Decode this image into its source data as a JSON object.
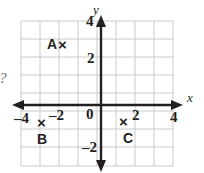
{
  "figure": {
    "stray_mark": "?",
    "axes": {
      "x_label": "x",
      "y_label": "y",
      "origin_label": "0",
      "x_ticks": [
        {
          "value": -4,
          "text": "–4"
        },
        {
          "value": -2,
          "text": "–2"
        },
        {
          "value": 2,
          "text": "2"
        },
        {
          "value": 4,
          "text": "4"
        }
      ],
      "y_ticks": [
        {
          "value": 4,
          "text": "4"
        },
        {
          "value": 2,
          "text": "2"
        },
        {
          "value": -2,
          "text": "–2"
        }
      ],
      "x_range": [
        -4,
        4
      ],
      "y_range": [
        -4,
        4
      ],
      "grid": true,
      "grid_step": 1
    },
    "points": [
      {
        "id": "A",
        "label": "A",
        "marker": "×",
        "x": -2,
        "y": 2.5
      },
      {
        "id": "B",
        "label": "B",
        "marker": "×",
        "x": -3,
        "y": -1
      },
      {
        "id": "C",
        "label": "C",
        "marker": "×",
        "x": 1.5,
        "y": -1
      }
    ],
    "colors": {
      "ink": "#231f20",
      "grid": "#c9cacb",
      "background": "#ffffff",
      "stray": "#6d6e71"
    }
  }
}
